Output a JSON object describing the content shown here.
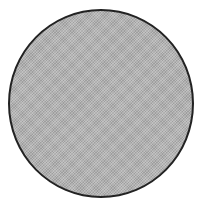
{
  "shape": {
    "type": "circle",
    "fill_color": "#b4b4b4",
    "stroke_color": "#222222",
    "background_color": "#ffffff"
  }
}
